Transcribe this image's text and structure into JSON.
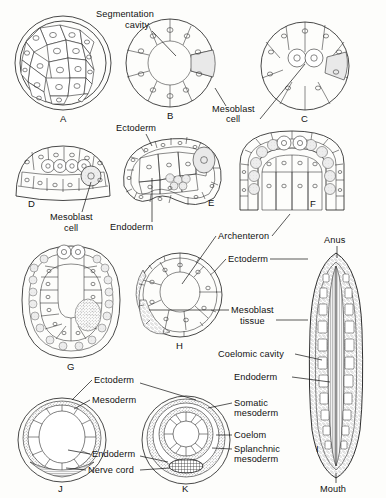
{
  "figure": {
    "background_color": "#fdfdfb",
    "ink_color": "#1a1a1a"
  },
  "labels": {
    "segmentation_cavity": "Segmentation\ncavity",
    "segmentation_cavity_line1": "Segmentation",
    "segmentation_cavity_line2": "cavity",
    "mesoblast_cell_line1": "Mesoblast",
    "mesoblast_cell_line2": "cell",
    "mesoblast_cell_2_line1": "Mesoblast",
    "mesoblast_cell_2_line2": "cell",
    "ectoderm_e": "Ectoderm",
    "endoderm_e": "Endoderm",
    "archenteron": "Archenteron",
    "ectoderm_h": "Ectoderm",
    "mesoblast_tissue_line1": "Mesoblast",
    "mesoblast_tissue_line2": "tissue",
    "anus": "Anus",
    "coelomic_cavity": "Coelomic cavity",
    "endoderm_i": "Endoderm",
    "mouth": "Mouth",
    "ectoderm_j": "Ectoderm",
    "mesoderm_j": "Mesoderm",
    "endoderm_j": "Endoderm",
    "nerve_cord": "Nerve cord",
    "somatic_mesoderm_line1": "Somatic",
    "somatic_mesoderm_line2": "mesoderm",
    "coelom": "Coelom",
    "splanchnic_mesoderm_line1": "Splanchnic",
    "splanchnic_mesoderm_line2": "mesoderm"
  },
  "panels": [
    {
      "id": "A",
      "letter": "A",
      "name": "morula",
      "caption": "Morula — solid ball of blastomeres"
    },
    {
      "id": "B",
      "letter": "B",
      "name": "blastula",
      "caption": "Blastula with segmentation cavity"
    },
    {
      "id": "C",
      "letter": "C",
      "name": "blastula-mesoblast",
      "caption": "Blastula with mesoblast cells"
    },
    {
      "id": "D",
      "letter": "D",
      "name": "early-gastrula",
      "caption": "Early gastrula, flattened vegetal plate"
    },
    {
      "id": "E",
      "letter": "E",
      "name": "gastrula-invagination",
      "caption": "Gastrula, beginning invagination"
    },
    {
      "id": "F",
      "letter": "F",
      "name": "gastrula-archenteron",
      "caption": "Gastrula with deep archenteron"
    },
    {
      "id": "G",
      "letter": "G",
      "name": "elongated-gastrula",
      "caption": "Elongated gastrula, U-shaped archenteron"
    },
    {
      "id": "H",
      "letter": "H",
      "name": "gastrula-cross-section",
      "caption": "Gastrula cross section with mesoblast tissue"
    },
    {
      "id": "I",
      "letter": "I",
      "name": "longitudinal-section-larva",
      "caption": "Longitudinal section of larva, mouth to anus"
    },
    {
      "id": "J",
      "letter": "J",
      "name": "cross-section-early-coelom",
      "caption": "Cross section, early mesoderm"
    },
    {
      "id": "K",
      "letter": "K",
      "name": "cross-section-coelom",
      "caption": "Cross section with coelom and nerve cord"
    }
  ]
}
